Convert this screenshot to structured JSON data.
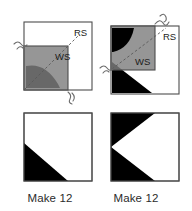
{
  "figure": {
    "kind": "sewing-assembly-diagram",
    "rows": [
      {
        "name": "construction-row",
        "units": [
          {
            "id": "unit-left-construction",
            "background_label": "RS",
            "overlay_label": "WS",
            "stitch_line": "dashed-diagonal",
            "thread_marks": 2
          },
          {
            "id": "unit-right-construction",
            "background_label": "RS",
            "overlay_label": "WS",
            "stitch_line": "dashed-diagonal",
            "thread_marks": 2
          }
        ]
      },
      {
        "name": "finished-row",
        "units": [
          {
            "id": "unit-left-finished",
            "shape": "half-square-triangle",
            "caption": "Make 12"
          },
          {
            "id": "unit-right-finished",
            "shape": "left-pointing-chevron",
            "caption": "Make 12"
          }
        ]
      }
    ]
  },
  "colors": {
    "fabric_right_side": "#ffffff",
    "fabric_wrong_side": "#7f7f7f",
    "fabric_dark": "#000000",
    "outline": "#4d4d4d",
    "stitch_line": "#595959",
    "caption_text": "#2b2b2b",
    "label_text": "#1c1c1c"
  },
  "labels": {
    "right_side": "RS",
    "wrong_side": "WS",
    "make_left": "Make 12",
    "make_right": "Make 12"
  }
}
